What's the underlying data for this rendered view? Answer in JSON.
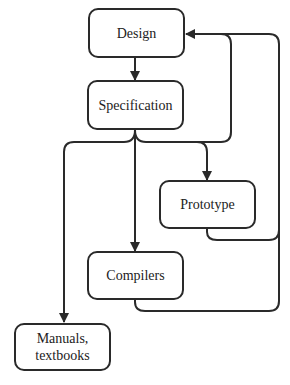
{
  "diagram": {
    "type": "flowchart",
    "nodes": [
      {
        "id": "design",
        "label": "Design"
      },
      {
        "id": "specification",
        "label": "Specification"
      },
      {
        "id": "prototype",
        "label": "Prototype"
      },
      {
        "id": "compilers",
        "label": "Compilers"
      },
      {
        "id": "manuals",
        "label": "Manuals,\ntextbooks"
      }
    ],
    "edges": [
      {
        "from": "design",
        "to": "specification"
      },
      {
        "from": "specification",
        "to": "prototype"
      },
      {
        "from": "specification",
        "to": "compilers"
      },
      {
        "from": "specification",
        "to": "manuals"
      },
      {
        "from": "prototype",
        "to": "design"
      },
      {
        "from": "compilers",
        "to": "design"
      }
    ],
    "colors": {
      "stroke": "#2a2a2a",
      "background": "#ffffff"
    }
  }
}
